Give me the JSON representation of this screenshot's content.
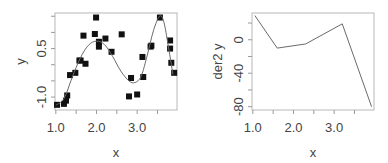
{
  "chart_data": [
    {
      "type": "scatter",
      "title": "",
      "xlabel": "x",
      "ylabel": "y",
      "xlim": [
        0.98,
        3.98
      ],
      "ylim": [
        -1.4,
        1.6
      ],
      "x_ticks": [
        1.0,
        1.5,
        2.0,
        2.5,
        3.0,
        3.5
      ],
      "x_tick_labels": [
        "1.0",
        "",
        "2.0",
        "",
        "3.0",
        ""
      ],
      "y_ticks": [
        -1.5,
        -1.0,
        -0.5,
        0.0,
        0.5,
        1.0,
        1.5
      ],
      "y_tick_labels": [
        "",
        "-1.0",
        "",
        "",
        "0.5",
        "",
        ""
      ],
      "grid": false,
      "series": [
        {
          "name": "points",
          "kind": "scatter",
          "marker": "square",
          "x": [
            1.03,
            1.2,
            1.25,
            1.28,
            1.35,
            1.48,
            1.58,
            1.61,
            1.73,
            1.68,
            1.99,
            1.96,
            2.06,
            2.06,
            2.22,
            2.37,
            2.62,
            2.85,
            2.8,
            3.0,
            3.15,
            3.13,
            3.33,
            3.35,
            3.56,
            3.81,
            3.81,
            3.84,
            3.91
          ],
          "y": [
            -1.24,
            -1.21,
            -1.11,
            -0.95,
            -0.32,
            -0.25,
            0.13,
            0.13,
            0.03,
            0.9,
            1.46,
            0.95,
            0.71,
            0.56,
            0.81,
            0.4,
            0.94,
            -0.41,
            -0.98,
            -0.92,
            -0.38,
            0.24,
            0.56,
            0.59,
            1.46,
            0.75,
            0.5,
            0.06,
            -0.25
          ]
        },
        {
          "name": "smooth fit",
          "kind": "line",
          "x": [
            1.0,
            1.2,
            1.4,
            1.6,
            1.8,
            2.0,
            2.2,
            2.4,
            2.6,
            2.8,
            2.95,
            3.1,
            3.25,
            3.4,
            3.55,
            3.65,
            3.75,
            3.88
          ],
          "y": [
            -1.25,
            -1.05,
            -0.4,
            0.2,
            0.6,
            0.73,
            0.62,
            0.25,
            -0.2,
            -0.5,
            -0.55,
            -0.35,
            0.3,
            1.05,
            1.5,
            1.35,
            0.7,
            -0.3
          ]
        }
      ]
    },
    {
      "type": "line",
      "title": "",
      "xlabel": "x",
      "ylabel": "der2 y",
      "xlim": [
        0.98,
        3.98
      ],
      "ylim": [
        -84,
        32
      ],
      "x_ticks": [
        1.0,
        1.5,
        2.0,
        2.5,
        3.0,
        3.5
      ],
      "x_tick_labels": [
        "1.0",
        "",
        "2.0",
        "",
        "3.0",
        ""
      ],
      "y_ticks": [
        -80,
        -60,
        -40,
        -20,
        0,
        20
      ],
      "y_tick_labels": [
        "-80",
        "",
        "-40",
        "",
        "0",
        ""
      ],
      "grid": false,
      "series": [
        {
          "name": "der2 y",
          "x": [
            1.05,
            1.6,
            2.3,
            3.2,
            3.92
          ],
          "y": [
            29,
            -10,
            -5,
            19,
            -80
          ]
        }
      ]
    }
  ],
  "panels": [
    {
      "id": "left",
      "box": {
        "x": 55,
        "y": 13,
        "w": 122,
        "h": 97
      }
    },
    {
      "id": "right",
      "box": {
        "x": 252,
        "y": 13,
        "w": 122,
        "h": 97
      }
    }
  ]
}
